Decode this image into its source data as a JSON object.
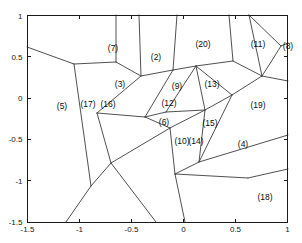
{
  "chart_data": {
    "type": "scatter",
    "title": "",
    "xlabel": "",
    "ylabel": "",
    "xlim": [
      -1.5,
      1.0
    ],
    "ylim": [
      -1.5,
      1.0
    ],
    "grid": false,
    "legend": "none",
    "xticks": [
      "-1.5",
      "-1",
      "-0.5",
      "0",
      "0.5",
      "1"
    ],
    "xtick_values": [
      -1.5,
      -1,
      -0.5,
      0,
      0.5,
      1
    ],
    "yticks": [
      "-1.5",
      "-1",
      "-0.5",
      "0",
      "0.5",
      "1"
    ],
    "ytick_values": [
      -1.5,
      -1,
      -0.5,
      0,
      0.5,
      1
    ],
    "point_labels": [
      "(2)",
      "(3)",
      "(4)",
      "(5)",
      "(6)",
      "(7)",
      "(8)",
      "(9)",
      "(10)",
      "(11)",
      "(12)",
      "(13)",
      "(14)",
      "(15)",
      "(16)",
      "(17)",
      "(18)",
      "(19)",
      "(20)"
    ],
    "points": [
      {
        "label": "(7)",
        "x": -0.68,
        "y": 0.69,
        "px": 113,
        "py": 49
      },
      {
        "label": "(2)",
        "x": -0.27,
        "y": 0.6,
        "px": 156,
        "py": 58
      },
      {
        "label": "(20)",
        "x": 0.19,
        "y": 0.73,
        "px": 203,
        "py": 45
      },
      {
        "label": "(11)",
        "x": 0.71,
        "y": 0.73,
        "px": 258,
        "py": 45
      },
      {
        "label": "(8)",
        "x": 1.0,
        "y": 0.7,
        "px": 288,
        "py": 47
      },
      {
        "label": "(3)",
        "x": -0.61,
        "y": 0.24,
        "px": 120,
        "py": 85
      },
      {
        "label": "(9)",
        "x": -0.06,
        "y": 0.22,
        "px": 177,
        "py": 87
      },
      {
        "label": "(13)",
        "x": 0.26,
        "y": 0.24,
        "px": 212,
        "py": 85
      },
      {
        "label": "(5)",
        "x": -1.17,
        "y": 0.0,
        "px": 62,
        "py": 107
      },
      {
        "label": "(17)",
        "x": -0.92,
        "y": 0.02,
        "px": 88,
        "py": 105
      },
      {
        "label": "(16)",
        "x": -0.73,
        "y": 0.02,
        "px": 108,
        "py": 105
      },
      {
        "label": "(12)",
        "x": -0.14,
        "y": 0.04,
        "px": 169,
        "py": 104
      },
      {
        "label": "(19)",
        "x": 0.7,
        "y": 0.02,
        "px": 258,
        "py": 106
      },
      {
        "label": "(6)",
        "x": -0.19,
        "y": -0.14,
        "px": 164,
        "py": 123
      },
      {
        "label": "(15)",
        "x": 0.25,
        "y": -0.15,
        "px": 210,
        "py": 124
      },
      {
        "label": "(10)",
        "x": -0.02,
        "y": -0.37,
        "px": 182,
        "py": 142
      },
      {
        "label": "(14)",
        "x": 0.11,
        "y": -0.37,
        "px": 196,
        "py": 142
      },
      {
        "label": "(4)",
        "x": 0.57,
        "y": -0.4,
        "px": 243,
        "py": 145
      },
      {
        "label": "(18)",
        "x": 0.78,
        "y": -1.03,
        "px": 265,
        "py": 198
      }
    ],
    "edges": [
      [
        [
          27,
          47
        ],
        [
          74,
          64
        ]
      ],
      [
        [
          74,
          64
        ],
        [
          116,
          62
        ]
      ],
      [
        [
          116,
          62
        ],
        [
          141,
          76
        ]
      ],
      [
        [
          141,
          76
        ],
        [
          173,
          70
        ]
      ],
      [
        [
          173,
          70
        ],
        [
          196,
          66
        ]
      ],
      [
        [
          196,
          66
        ],
        [
          233,
          61
        ]
      ],
      [
        [
          233,
          61
        ],
        [
          262,
          76
        ]
      ],
      [
        [
          262,
          76
        ],
        [
          288,
          81
        ]
      ],
      [
        [
          116,
          15
        ],
        [
          116,
          62
        ]
      ],
      [
        [
          139,
          15
        ],
        [
          141,
          76
        ]
      ],
      [
        [
          177,
          15
        ],
        [
          173,
          70
        ]
      ],
      [
        [
          229,
          15
        ],
        [
          233,
          61
        ]
      ],
      [
        [
          249,
          15
        ],
        [
          262,
          76
        ]
      ],
      [
        [
          249,
          15
        ],
        [
          281,
          46
        ]
      ],
      [
        [
          281,
          46
        ],
        [
          288,
          43
        ]
      ],
      [
        [
          281,
          46
        ],
        [
          271,
          62
        ]
      ],
      [
        [
          271,
          62
        ],
        [
          262,
          76
        ]
      ],
      [
        [
          74,
          64
        ],
        [
          91,
          186
        ]
      ],
      [
        [
          91,
          186
        ],
        [
          66,
          222
        ]
      ],
      [
        [
          91,
          186
        ],
        [
          111,
          163
        ]
      ],
      [
        [
          111,
          163
        ],
        [
          97,
          113
        ]
      ],
      [
        [
          97,
          113
        ],
        [
          141,
          76
        ]
      ],
      [
        [
          97,
          113
        ],
        [
          145,
          117
        ]
      ],
      [
        [
          145,
          117
        ],
        [
          173,
          70
        ]
      ],
      [
        [
          145,
          117
        ],
        [
          166,
          112
        ]
      ],
      [
        [
          166,
          112
        ],
        [
          196,
          66
        ]
      ],
      [
        [
          166,
          112
        ],
        [
          205,
          110
        ]
      ],
      [
        [
          205,
          110
        ],
        [
          196,
          66
        ]
      ],
      [
        [
          205,
          110
        ],
        [
          232,
          95
        ]
      ],
      [
        [
          232,
          95
        ],
        [
          196,
          66
        ]
      ],
      [
        [
          232,
          95
        ],
        [
          262,
          76
        ]
      ],
      [
        [
          145,
          117
        ],
        [
          170,
          128
        ]
      ],
      [
        [
          170,
          128
        ],
        [
          111,
          163
        ]
      ],
      [
        [
          111,
          163
        ],
        [
          156,
          222
        ]
      ],
      [
        [
          170,
          128
        ],
        [
          205,
          110
        ]
      ],
      [
        [
          170,
          128
        ],
        [
          175,
          174
        ]
      ],
      [
        [
          175,
          174
        ],
        [
          199,
          162
        ]
      ],
      [
        [
          199,
          162
        ],
        [
          205,
          110
        ]
      ],
      [
        [
          199,
          162
        ],
        [
          232,
          95
        ]
      ],
      [
        [
          199,
          162
        ],
        [
          288,
          135
        ]
      ],
      [
        [
          175,
          174
        ],
        [
          185,
          222
        ]
      ],
      [
        [
          175,
          174
        ],
        [
          248,
          178
        ]
      ],
      [
        [
          248,
          178
        ],
        [
          288,
          169
        ]
      ]
    ]
  }
}
